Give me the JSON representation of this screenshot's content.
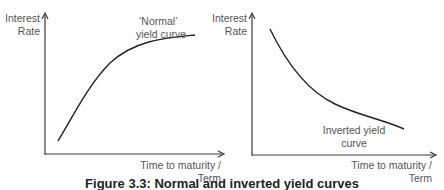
{
  "left_panel": {
    "y_axis_label_line1": "Interest",
    "y_axis_label_line2": "Rate",
    "x_axis_label_line1": "Time to maturity /",
    "x_axis_label_line2": "Term",
    "curve_label_line1": "‘Normal’",
    "curve_label_line2": "yield curve",
    "curve_shape": "upward sloping, concave (flattens at longer maturities)"
  },
  "right_panel": {
    "y_axis_label_line1": "Interest",
    "y_axis_label_line2": "Rate",
    "x_axis_label_line1": "Time to maturity /",
    "x_axis_label_line2": "Term",
    "curve_label_line1": "Inverted yield",
    "curve_label_line2": "curve",
    "curve_shape": "downward sloping, convex (flattens at longer maturities)"
  },
  "caption": "Figure 3.3: Normal and inverted yield curves",
  "colors": {
    "axis": "#3a3a3a",
    "curve": "#222222",
    "label_text": "#555555",
    "background": "#ffffff"
  }
}
